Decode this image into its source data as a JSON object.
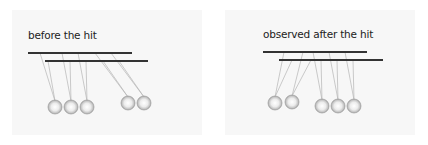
{
  "panels": [
    {
      "id": "before",
      "title": "before the hit",
      "bars": [
        {
          "x1": 28,
          "x2": 132,
          "y": 53
        },
        {
          "x1": 45,
          "x2": 148,
          "y": 61
        }
      ],
      "balls": [
        {
          "cx": 55,
          "cy": 107,
          "string_top_x": 48,
          "string_top_y": 61
        },
        {
          "cx": 71,
          "cy": 107,
          "string_top_x": 62,
          "string_top_y": 53
        },
        {
          "cx": 87,
          "cy": 107,
          "string_top_x": 78,
          "string_top_y": 53
        },
        {
          "cx": 128,
          "cy": 103,
          "string_top_x": 95,
          "string_top_y": 53
        },
        {
          "cx": 144,
          "cy": 103,
          "string_top_x": 111,
          "string_top_y": 53
        }
      ]
    },
    {
      "id": "after",
      "title": "observed after the hit",
      "bars": [
        {
          "x1": 263,
          "x2": 367,
          "y": 52
        },
        {
          "x1": 279,
          "x2": 383,
          "y": 60
        }
      ],
      "balls": [
        {
          "cx": 275,
          "cy": 103,
          "string_top_x": 292,
          "string_top_y": 60
        },
        {
          "cx": 292,
          "cy": 102,
          "string_top_x": 311,
          "string_top_y": 60
        },
        {
          "cx": 322,
          "cy": 106,
          "string_top_x": 313,
          "string_top_y": 52
        },
        {
          "cx": 338,
          "cy": 106,
          "string_top_x": 329,
          "string_top_y": 52
        },
        {
          "cx": 354,
          "cy": 106,
          "string_top_x": 345,
          "string_top_y": 52
        }
      ]
    }
  ]
}
